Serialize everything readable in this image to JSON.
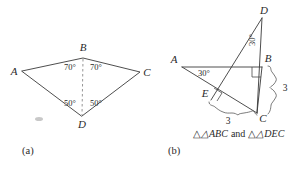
{
  "figure": {
    "panel_a": {
      "panel_label": "(a)",
      "vertices": {
        "A": "A",
        "B": "B",
        "C": "C",
        "D": "D"
      },
      "angles": {
        "abd": "70°",
        "dbc": "70°",
        "adb": "50°",
        "bdc": "50°"
      },
      "description": "Kite ABCD with dashed diagonal BD; angles at B are 70 degrees each, angles at D are 50 degrees each"
    },
    "panel_b": {
      "panel_label": "(b)",
      "vertices": {
        "A": "A",
        "B": "B",
        "C": "C",
        "D": "D",
        "E": "E"
      },
      "angles": {
        "at_a": "30°",
        "at_d": "30°"
      },
      "side_lengths": {
        "bc": "3",
        "ec": "3"
      },
      "right_angle_marks": [
        "angle-abc",
        "angle-aec"
      ],
      "caption_prefix": "△ABC",
      "caption_join": "and",
      "caption_suffix": "△DEC",
      "caption_full": "△ABC and △DEC"
    }
  }
}
